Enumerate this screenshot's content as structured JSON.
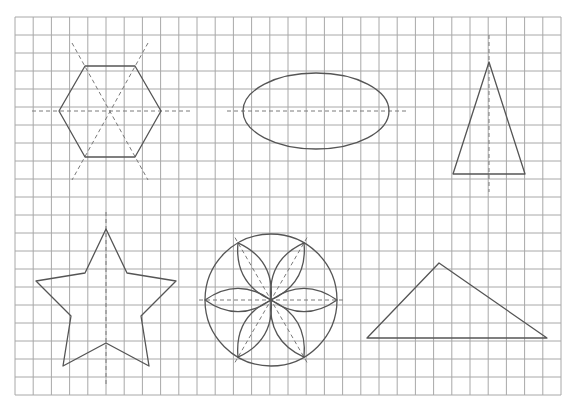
{
  "colors": {
    "background": "#ffffff",
    "grid": "#a8a8a8",
    "shape": "#555555",
    "axis": "#7a7a7a"
  },
  "grid": {
    "x0": 15,
    "y0": 17,
    "cols": 30,
    "rows": 21,
    "cellW": 18.2,
    "cellH": 18
  },
  "shapes": [
    {
      "name": "regular-hexagon",
      "type": "polygon",
      "points": [
        [
          59,
          111
        ],
        [
          85,
          66
        ],
        [
          135,
          66
        ],
        [
          161,
          111
        ],
        [
          135,
          157
        ],
        [
          85,
          157
        ]
      ],
      "axes": [
        [
          [
            32,
            111
          ],
          [
            190,
            111
          ]
        ],
        [
          [
            72,
            43
          ],
          [
            148,
            180
          ]
        ],
        [
          [
            148,
            43
          ],
          [
            72,
            180
          ]
        ]
      ]
    },
    {
      "name": "ellipse",
      "type": "ellipse",
      "cx": 316,
      "cy": 111,
      "rx": 73,
      "ry": 38,
      "axes": [
        [
          [
            227,
            111
          ],
          [
            408,
            111
          ]
        ]
      ]
    },
    {
      "name": "isosceles-triangle",
      "type": "polygon",
      "points": [
        [
          489,
          62
        ],
        [
          453,
          174
        ],
        [
          525,
          174
        ]
      ],
      "axes": [
        [
          [
            489,
            35
          ],
          [
            489,
            192
          ]
        ]
      ]
    },
    {
      "name": "five-point-star",
      "type": "polygon",
      "points": [
        [
          106,
          229
        ],
        [
          127,
          273
        ],
        [
          176,
          281
        ],
        [
          141,
          316
        ],
        [
          149,
          366
        ],
        [
          106,
          343
        ],
        [
          63,
          366
        ],
        [
          71,
          316
        ],
        [
          36,
          281
        ],
        [
          85,
          273
        ]
      ],
      "axes": [
        [
          [
            106,
            212
          ],
          [
            106,
            386
          ]
        ]
      ]
    },
    {
      "name": "flower-in-circle",
      "type": "flower",
      "cx": 271,
      "cy": 300,
      "r": 66,
      "petals": 6,
      "petalBulge": 18,
      "axisOverhang": 6
    },
    {
      "name": "scalene-triangle",
      "type": "polygon",
      "points": [
        [
          439,
          263
        ],
        [
          367,
          338
        ],
        [
          547,
          338
        ]
      ],
      "axes": []
    }
  ]
}
